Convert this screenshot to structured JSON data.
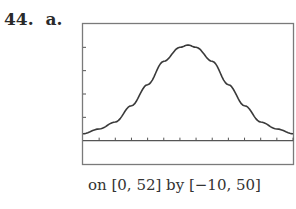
{
  "problem": {
    "number": "44.",
    "part": "a."
  },
  "caption": "on [0, 52] by [−10, 50]",
  "colors": {
    "frame": "#7a7a7a",
    "curve": "#3a3a3a",
    "axis": "#555555"
  },
  "chart_data": {
    "type": "line",
    "title": "",
    "xlabel": "",
    "ylabel": "",
    "xlim": [
      0,
      52
    ],
    "ylim": [
      -10,
      50
    ],
    "xtick_step": 4,
    "ytick_step": 10,
    "grid": false,
    "legend": null,
    "annotation": "on [0, 52] by [−10, 50]",
    "x": [
      0,
      4,
      8,
      12,
      16,
      20,
      24,
      26,
      28,
      32,
      36,
      40,
      44,
      48,
      52
    ],
    "values": [
      3,
      5,
      8,
      15,
      24,
      34,
      40,
      41,
      40,
      34,
      24,
      15,
      8,
      5,
      3
    ]
  }
}
